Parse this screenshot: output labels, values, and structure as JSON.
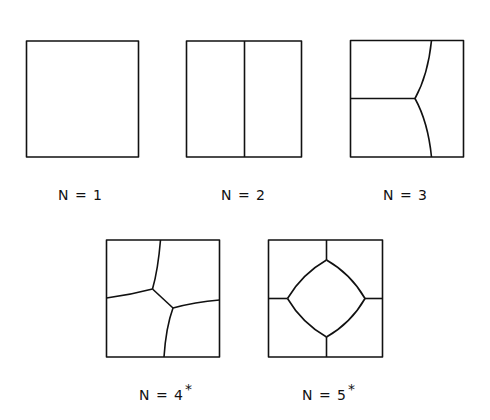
{
  "figure": {
    "panels": [
      {
        "id": "n1",
        "label": "N = 1",
        "star": ""
      },
      {
        "id": "n2",
        "label": "N = 2",
        "star": ""
      },
      {
        "id": "n3",
        "label": "N = 3",
        "star": ""
      },
      {
        "id": "n4",
        "label": "N = 4",
        "star": "*"
      },
      {
        "id": "n5",
        "label": "N = 5",
        "star": "*"
      }
    ],
    "colors": {
      "line": "#111111",
      "background": "#ffffff"
    }
  }
}
